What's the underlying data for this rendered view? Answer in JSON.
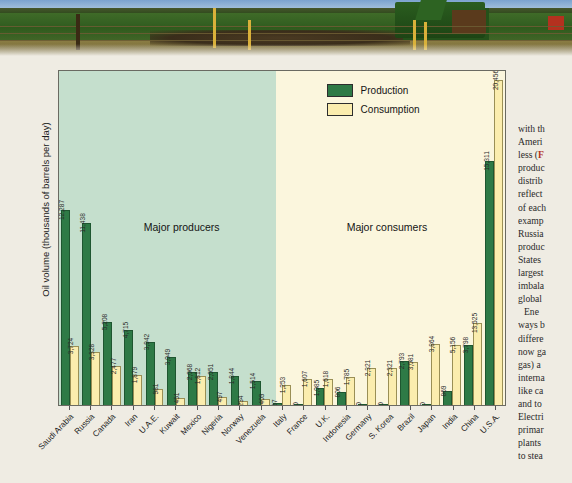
{
  "photo": {
    "alt": "farm field with fence posts and green tractor"
  },
  "chart_data": {
    "type": "bar",
    "title": "",
    "xlabel": "",
    "ylabel": "Oil volume (thousands of barrels per day)",
    "ylim": [
      0,
      21000
    ],
    "grid": false,
    "legend_position": "top-right",
    "band_labels": [
      "Major producers",
      "Major consumers"
    ],
    "categories": [
      "Saudi Arabia",
      "Russia",
      "Canada",
      "Iran",
      "U.A.E.",
      "Kuwait",
      "Mexico",
      "Nigeria",
      "Norway",
      "Venezuela",
      "Italy",
      "France",
      "U.K.",
      "Indonesia",
      "Germany",
      "S. Korea",
      "Brazil",
      "Japan",
      "India",
      "China",
      "U.S.A."
    ],
    "series": [
      {
        "name": "Production",
        "color": "#2e7a46",
        "values": [
          12287,
          11438,
          5208,
          4715,
          3942,
          3049,
          2068,
          2051,
          1844,
          1514,
          97,
          0,
          1085,
          806,
          0,
          0,
          2793,
          0,
          869,
          3798,
          15311
        ],
        "labels": [
          "12,287",
          "11,438",
          "5,208",
          "4,715",
          "3,942",
          "3,049",
          "2,068",
          "2,051",
          "1,844",
          "1,514",
          "97",
          "0",
          "1,085",
          "806",
          "0",
          "0",
          "2,793",
          "0",
          "869",
          "3,798",
          "15,311"
        ]
      },
      {
        "name": "Consumption",
        "color": "#fbedae",
        "values": [
          3724,
          3328,
          2477,
          1879,
          981,
          451,
          1812,
          497,
          234,
          409,
          1253,
          1607,
          1618,
          1785,
          2321,
          2321,
          2683,
          3864,
          3798,
          5156,
          20456
        ],
        "labels": [
          "3,724",
          "3,328",
          "2,477",
          "1,879",
          "981",
          "451",
          "1,812",
          "497",
          "234",
          "409",
          "1,253",
          "1,607",
          "1,618",
          "1,785",
          "2,321",
          "2,321",
          "3,081",
          "3,864",
          "5,156",
          "13,525",
          "20,456"
        ]
      }
    ]
  },
  "legend": {
    "production": "Production",
    "consumption": "Consumption"
  },
  "article": {
    "lines": [
      "with th",
      "Ameri",
      "less (F",
      "produc",
      "distrib",
      "reflect",
      "of each",
      "examp",
      "Russia",
      "produc",
      "States",
      "largest",
      "imbala",
      "global",
      "Ene",
      "ways b",
      "differe",
      "now ga",
      "gas) a",
      "interna",
      "like ca",
      "and to",
      "Electri",
      "primar",
      "plants",
      "to stea"
    ]
  },
  "colors": {
    "production": "#2e7a46",
    "consumption": "#fbedae",
    "producer_band": "#c5dfcd",
    "consumer_band": "#fbf6dd",
    "page_bg": "#efece3"
  }
}
